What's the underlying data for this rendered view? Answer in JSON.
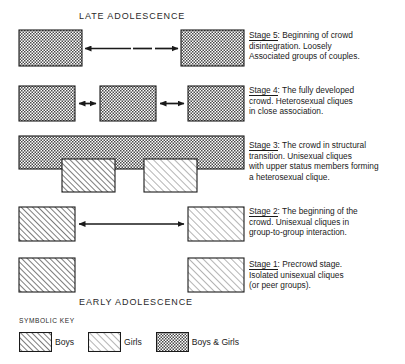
{
  "figure": {
    "top_label": "LATE ADOLESCENCE",
    "bottom_label": "EARTLY_PLACEHOLDER"
  },
  "headers": {
    "late": "LATE ADOLESCENCE",
    "early": "EARLY ADOLESCENCE"
  },
  "descriptions": {
    "stage5": {
      "label": "Stage 5",
      "text": ": Beginning of crowd\ndisintegration. Loosely\nAssociated groups of couples."
    },
    "stage4": {
      "label": "Stage 4",
      "text": ": The fully developed\ncrowd. Heterosexual cliques\nin close association."
    },
    "stage3": {
      "label": "Stage 3",
      "text": ": The crowd in structural\ntransition. Unisexual cliques\nwith upper status members forming\na heterosexual clique."
    },
    "stage2": {
      "label": "Stage 2",
      "text": ": The beginning of the\ncrowd. Unisexual cliques in\ngroup-to-group interaction."
    },
    "stage1": {
      "label": "Stage 1",
      "text": ": Precrowd stage.\nIsolated unisexual cliques\n(or peer groups)."
    }
  },
  "legend": {
    "title": "SYMBOLIC KEY",
    "items": [
      {
        "pattern": "boys",
        "label": "Boys"
      },
      {
        "pattern": "girls",
        "label": "Girls"
      },
      {
        "pattern": "boys-and-girls",
        "label": "Boys & Girls"
      }
    ]
  },
  "diagram": {
    "colors": {
      "stroke": "#1a1a1a",
      "hatch": "#555555",
      "background": "#ffffff"
    },
    "stages": [
      {
        "id": "stage5",
        "boxes": [
          {
            "name": "crowd-group-left",
            "pattern": "boys-and-girls",
            "x": 19,
            "y": 30,
            "w": 63,
            "h": 36
          },
          {
            "name": "crowd-group-right",
            "pattern": "boys-and-girls",
            "x": 181,
            "y": 30,
            "w": 63,
            "h": 36
          }
        ],
        "connector": "dashed-double-arrow"
      },
      {
        "id": "stage4",
        "boxes": [
          {
            "name": "clique-left",
            "pattern": "boys-and-girls",
            "x": 19,
            "y": 86,
            "w": 56,
            "h": 35
          },
          {
            "name": "clique-center",
            "pattern": "boys-and-girls",
            "x": 100,
            "y": 86,
            "w": 56,
            "h": 35
          },
          {
            "name": "clique-right",
            "pattern": "boys-and-girls",
            "x": 188,
            "y": 86,
            "w": 56,
            "h": 35
          }
        ],
        "connector": "double-arrow"
      },
      {
        "id": "stage3",
        "boxes": [
          {
            "name": "crowd-bar",
            "pattern": "boys-and-girls",
            "x": 19,
            "y": 136,
            "w": 225,
            "h": 33
          },
          {
            "name": "boys-clique",
            "pattern": "boys",
            "x": 62,
            "y": 159,
            "w": 53,
            "h": 33
          },
          {
            "name": "girls-clique",
            "pattern": "girls",
            "x": 144,
            "y": 159,
            "w": 53,
            "h": 33
          }
        ],
        "connector": "none"
      },
      {
        "id": "stage2",
        "boxes": [
          {
            "name": "boys-clique",
            "pattern": "boys",
            "x": 19,
            "y": 207,
            "w": 56,
            "h": 34
          },
          {
            "name": "girls-clique",
            "pattern": "girls",
            "x": 188,
            "y": 207,
            "w": 56,
            "h": 34
          }
        ],
        "connector": "double-arrow"
      },
      {
        "id": "stage1",
        "boxes": [
          {
            "name": "boys-clique",
            "pattern": "boys",
            "x": 19,
            "y": 258,
            "w": 56,
            "h": 34
          },
          {
            "name": "girls-clique",
            "pattern": "girls",
            "x": 188,
            "y": 258,
            "w": 56,
            "h": 34
          }
        ],
        "connector": "none"
      }
    ]
  }
}
